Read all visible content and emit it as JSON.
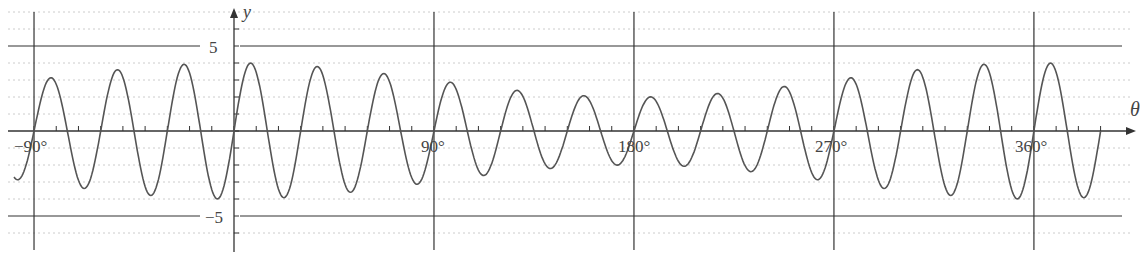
{
  "chart_data": {
    "type": "line",
    "title": "",
    "xlabel": "θ",
    "ylabel": "y",
    "xlim": [
      -99,
      390
    ],
    "ylim": [
      -6,
      7
    ],
    "x_ticks": [
      -90,
      90,
      180,
      270,
      360
    ],
    "x_tick_labels": [
      "-90°",
      "90°",
      "180°",
      "270°",
      "360°"
    ],
    "y_ticks": [
      5,
      -5
    ],
    "y_tick_labels": [
      "5",
      "-5"
    ],
    "reference_lines": {
      "horizontal": [
        5,
        -5
      ],
      "vertical": [
        -90,
        90,
        180,
        270,
        360
      ]
    },
    "grid": "dashed horizontal every 1 unit",
    "series": [
      {
        "name": "y = (3 + cos θ) sin 12θ",
        "period_deg": 30,
        "amplitude_at": {
          "-90": 3,
          "0": 4,
          "90": 3,
          "180": 2,
          "270": 3,
          "360": 4
        }
      }
    ]
  },
  "labels": {
    "x_axis": "θ",
    "y_axis": "y",
    "y5": "5",
    "yneg5": "−5",
    "xm90": "−90°",
    "x90": "90°",
    "x180": "180°",
    "x270": "270°",
    "x360": "360°"
  }
}
